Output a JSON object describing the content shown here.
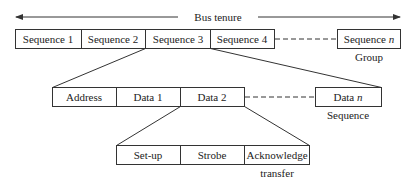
{
  "bus_tenure": {
    "label": "Bus tenure"
  },
  "group": {
    "sequences": [
      "Sequence 1",
      "Sequence 2",
      "Sequence 3",
      "Sequence 4"
    ],
    "last_prefix": "Sequence ",
    "last_var": "n",
    "caption": "Group"
  },
  "sequence": {
    "cells": [
      "Address",
      "Data 1",
      "Data 2"
    ],
    "last_prefix": "Data ",
    "last_var": "n",
    "caption": "Sequence"
  },
  "transfer": {
    "cells": [
      "Set-up",
      "Strobe",
      "Acknowledge"
    ],
    "caption": "transfer"
  }
}
